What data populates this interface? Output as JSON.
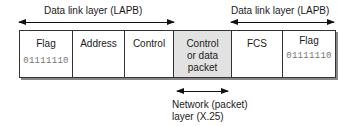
{
  "title_left": "Data link layer (LAPB)",
  "title_right": "Data link layer (LAPB)",
  "fields": [
    {
      "name": "Flag",
      "bits": "01111110",
      "shaded": false
    },
    {
      "name": "Address",
      "bits": "",
      "shaded": false
    },
    {
      "name": "Control",
      "bits": "",
      "shaded": false
    },
    {
      "name": "Control or data packet",
      "line1": "Control",
      "line2": "or data",
      "line3": "packet",
      "bits": "",
      "shaded": true
    },
    {
      "name": "FCS",
      "bits": "",
      "shaded": false
    },
    {
      "name": "Flag",
      "bits": "01111110",
      "shaded": false
    }
  ],
  "network_label": {
    "line1": "Network (packet)",
    "line2": "layer (X.25)"
  },
  "colors": {
    "shaded": "#e2e2e2",
    "border": "#333333",
    "bits": "#777777"
  }
}
